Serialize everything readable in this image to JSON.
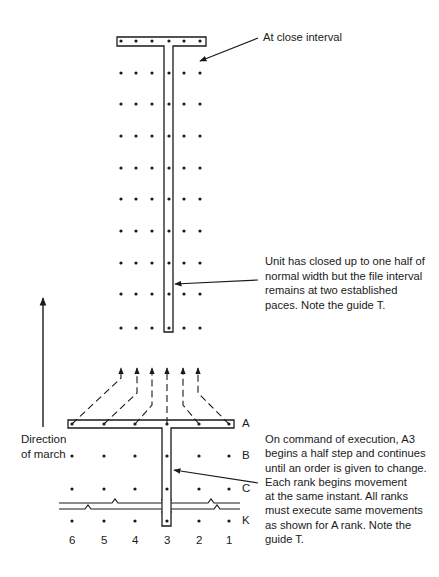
{
  "annotations": {
    "close_interval": "At close interval",
    "closed_up": "Unit has closed up to one half of\nnormal width but the file interval\nremains at two established\npaces. Note the guide T.",
    "direction": "Direction\nof march",
    "command": "On command of execution, A3\nbegins a half step and continues\nuntil an order is given to change.\nEach rank begins movement\nat the same instant. All ranks\nmust execute same movements\nas shown for A rank. Note the\nguide T."
  },
  "ranks": [
    "A",
    "B",
    "C",
    "K"
  ],
  "files": [
    "6",
    "5",
    "4",
    "3",
    "2",
    "1"
  ],
  "colors": {
    "ink": "#1a1a1a",
    "background": "#ffffff"
  },
  "layout": {
    "upper_dot_x": [
      121,
      136,
      152,
      169,
      184,
      200
    ],
    "upper_rows_y": [
      73,
      104,
      136,
      168,
      199,
      231,
      263,
      294,
      328
    ],
    "lower_dot_x": [
      72,
      104,
      135,
      167,
      199,
      229
    ],
    "lower_rows_y": [
      424,
      456,
      489,
      521
    ],
    "arrow_tip_x": [
      121,
      137,
      152,
      167,
      183,
      198
    ]
  }
}
